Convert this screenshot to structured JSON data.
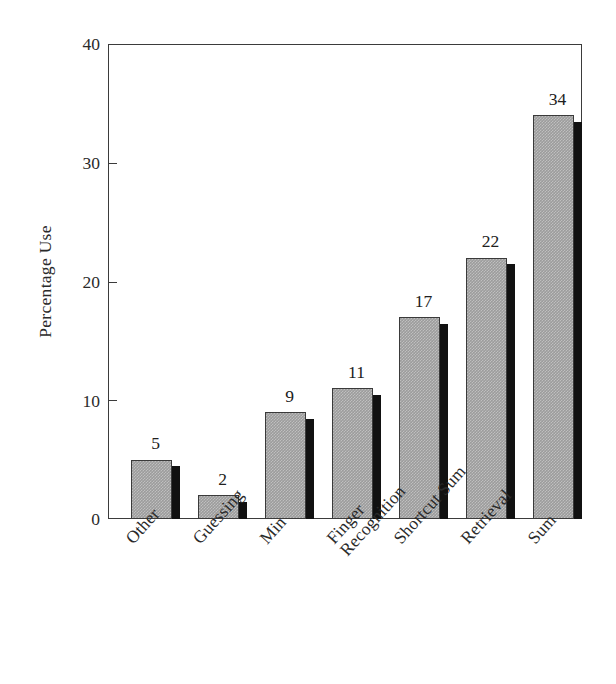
{
  "chart_data": {
    "type": "bar",
    "title": "",
    "subtitle": "",
    "xlabel": "",
    "ylabel": "Percentage Use",
    "categories": [
      "Other",
      "Guessing",
      "Min",
      "Finger Recognition",
      "Shortcut Sum",
      "Retrieval",
      "Sum"
    ],
    "values": [
      5,
      2,
      9,
      11,
      17,
      22,
      34
    ],
    "value_labels": [
      "5",
      "2",
      "9",
      "11",
      "17",
      "22",
      "34"
    ],
    "ylim": [
      0,
      40
    ],
    "yticks": [
      40,
      30,
      20,
      10,
      0
    ],
    "ytick_labels": [
      "40",
      "30",
      "20",
      "10",
      "0"
    ],
    "grid": false,
    "legend": null,
    "legend_position": "none",
    "series": [
      {
        "name": "Percentage Use",
        "values": [
          5,
          2,
          9,
          11,
          17,
          22,
          34
        ]
      }
    ],
    "annotations": [],
    "style": {
      "bar_fill": "#9c9c9c",
      "bar_edge": "#3a3a3a",
      "bar_shadow": "#111111",
      "frame_color": "#3b3b3b",
      "background": "#ffffff",
      "text_color": "#2a2a2a",
      "label_rotation_degrees": -48,
      "three_d_shadow": true
    }
  },
  "category_label_lines": [
    [
      "Other"
    ],
    [
      "Guessing"
    ],
    [
      "Min"
    ],
    [
      "Finger",
      "Recognition"
    ],
    [
      "Shortcut Sum"
    ],
    [
      "Retrieval"
    ],
    [
      "Sum"
    ]
  ]
}
